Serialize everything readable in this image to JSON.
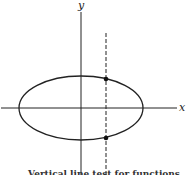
{
  "diagram": {
    "axes": {
      "x_label": "x",
      "y_label": "y"
    },
    "ellipse": {
      "cx": 81,
      "cy": 108,
      "rx": 62,
      "ry": 32
    },
    "vertical_line": {
      "x": 106,
      "style": "dashed"
    },
    "intersection_points": [
      {
        "x": 106,
        "y": 79
      },
      {
        "x": 106,
        "y": 138
      }
    ],
    "caption_partial": "Vertical line test for functions",
    "stroke_color": "#222222"
  }
}
